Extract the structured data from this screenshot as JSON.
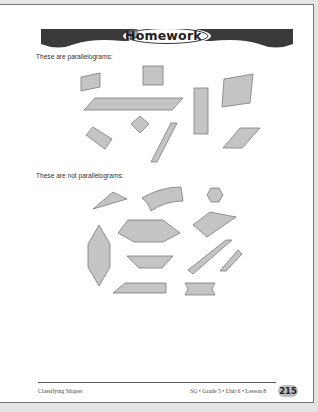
{
  "header": {
    "title": "Homework",
    "icon": "book-icon"
  },
  "sections": [
    {
      "caption": "These are parallelograms:"
    },
    {
      "caption": "These are not parallelograms:"
    }
  ],
  "footer": {
    "left": "Classifying Shapes",
    "right": "SG • Grade 5 • Unit 6 • Lesson 8",
    "page_number": "215"
  },
  "colors": {
    "shape_fill": "#c4c4c4",
    "shape_stroke": "#7a7a7a",
    "banner": "#3a3a3a"
  }
}
